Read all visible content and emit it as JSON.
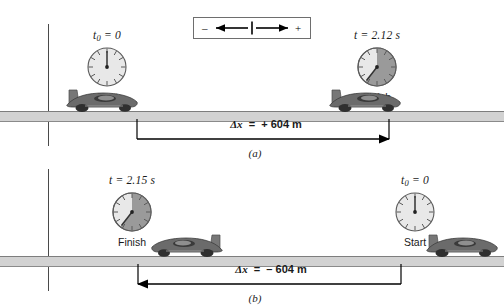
{
  "figure": {
    "legend": {
      "name": "direction-legend",
      "negative_sign": "–",
      "positive_sign": "+",
      "left_arrow": "left-arrow-icon",
      "right_arrow": "right-arrow-icon",
      "origin_tick": "origin-tick"
    },
    "panels": [
      {
        "caption": "(a)",
        "name": "panel-a",
        "direction": "positive",
        "left_clock": {
          "time_main": "t",
          "time_sub": "0",
          "time_text": "= 0",
          "label": "Start",
          "elapsed_fraction": 0.0
        },
        "right_clock": {
          "time_main": "t",
          "time_sub": "",
          "time_text": "= 2.12 s",
          "label": "Finish",
          "elapsed_fraction": 0.63
        },
        "measurement": {
          "symbol": "Δx",
          "equals": "=",
          "value": "+ 604 m",
          "full_text": "Δx  =  + 604 m",
          "arrow_direction": "right"
        },
        "cars": [
          {
            "name": "car-start",
            "facing": "right"
          },
          {
            "name": "car-finish",
            "facing": "right"
          }
        ]
      },
      {
        "caption": "(b)",
        "name": "panel-b",
        "direction": "negative",
        "left_clock": {
          "time_main": "t",
          "time_sub": "",
          "time_text": "= 2.15 s",
          "label": "Finish",
          "elapsed_fraction": 0.63
        },
        "right_clock": {
          "time_main": "t",
          "time_sub": "0",
          "time_text": "= 0",
          "label": "Start",
          "elapsed_fraction": 0.0
        },
        "measurement": {
          "symbol": "Δx",
          "equals": "=",
          "value": "– 604 m",
          "full_text": "Δx  =  – 604 m",
          "arrow_direction": "left"
        },
        "cars": [
          {
            "name": "car-finish",
            "facing": "left"
          },
          {
            "name": "car-start",
            "facing": "right"
          }
        ]
      }
    ],
    "colors": {
      "road_top_edge": "#7d7d7d",
      "road_fill": "#d2d2d2",
      "road_bottom_edge": "#8a8a8a",
      "axis": "#4a4a4a",
      "arrow": "#000000",
      "clock_face": "#e8e8e8",
      "clock_sector": "#9a9a9a",
      "car_body": "#6b6b6b",
      "text": "#1a1a1a"
    }
  }
}
